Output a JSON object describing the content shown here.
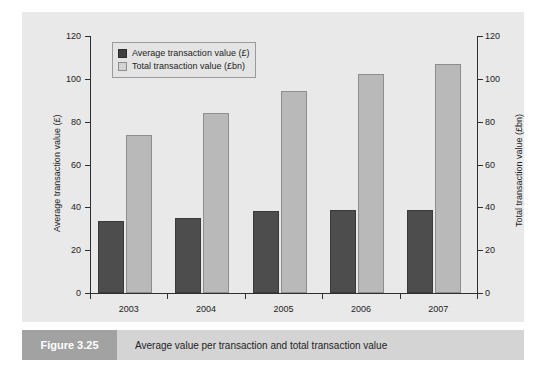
{
  "figure": {
    "caption_tag": "Figure 3.25",
    "caption_text": "Average value per transaction and total transaction value"
  },
  "legend": {
    "items": [
      {
        "label": "Average transaction value (£)",
        "swatch": "dark-swatch-icon",
        "color": "#3f3f3f"
      },
      {
        "label": "Total transaction value (£bn)",
        "swatch": "light-swatch-icon",
        "color": "#d3d3d3"
      }
    ]
  },
  "chart_data": {
    "type": "bar",
    "title": "Average value per transaction and total transaction value",
    "categories": [
      "2003",
      "2004",
      "2005",
      "2006",
      "2007"
    ],
    "series": [
      {
        "name": "Average transaction value (£)",
        "axis": "left",
        "color": "#4d4d4d",
        "values": [
          33.5,
          34.8,
          38.3,
          38.8,
          38.6
        ]
      },
      {
        "name": "Total transaction value (£bn)",
        "axis": "right",
        "color": "#b9b9b9",
        "values": [
          73.7,
          84.0,
          94.5,
          102.3,
          107.0
        ]
      }
    ],
    "xlabel": "",
    "ylabel": "Average transaction value (£)",
    "ylabel_right": "Total transaction value (£bn)",
    "ylim": [
      0,
      120
    ],
    "ylim_right": [
      0,
      120
    ],
    "yticks": [
      0,
      20,
      40,
      60,
      80,
      100,
      120
    ],
    "yticks_right": [
      0,
      20,
      40,
      60,
      80,
      100,
      120
    ],
    "grid": false,
    "legend_position": "top-left"
  }
}
